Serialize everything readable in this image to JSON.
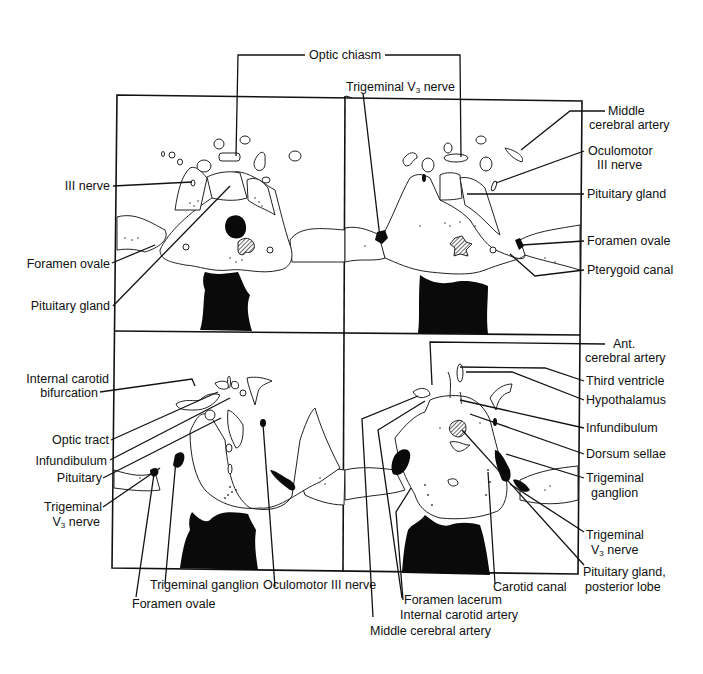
{
  "figure": {
    "panels": [
      {
        "id": "top-left",
        "position": "upper-left"
      },
      {
        "id": "top-right",
        "position": "upper-right"
      },
      {
        "id": "bottom-left",
        "position": "lower-left"
      },
      {
        "id": "bottom-right",
        "position": "lower-right"
      }
    ],
    "labels": {
      "optic_chiasm": "Optic chiasm",
      "trigeminal_v3_top_a": "Trigeminal V",
      "trigeminal_v3_top_sub": "3",
      "trigeminal_v3_top_b": " nerve",
      "middle_cerebral_artery_1": "Middle",
      "middle_cerebral_artery_2": "cerebral artery",
      "oculomotor_1": "Oculomotor",
      "oculomotor_2": "III nerve",
      "pituitary_gland_tr": "Pituitary gland",
      "foramen_ovale_tr": "Foramen ovale",
      "pterygoid_canal": "Pterygoid canal",
      "iii_nerve": "III nerve",
      "foramen_ovale_tl": "Foramen ovale",
      "pituitary_gland_tl": "Pituitary gland",
      "internal_carotid_bif_1": "Internal carotid",
      "internal_carotid_bif_2": "bifurcation",
      "optic_tract": "Optic tract",
      "infundibulum_bl": "Infundibulum",
      "pituitary_bl": "Pituitary",
      "trigeminal_v3_bl_1": "Trigeminal",
      "trigeminal_v3_bl_2a": "V",
      "trigeminal_v3_bl_2sub": "3",
      "trigeminal_v3_bl_2b": " nerve",
      "trigeminal_ganglion_bl": "Trigeminal ganglion",
      "foramen_ovale_bl": "Foramen ovale",
      "oculomotor_iii_bl": "Oculomotor III nerve",
      "ant_cerebral_1": "Ant.",
      "ant_cerebral_2": "cerebral artery",
      "third_ventricle": "Third ventricle",
      "hypothalamus": "Hypothalamus",
      "infundibulum_br": "Infundibulum",
      "dorsum_sellae": "Dorsum sellae",
      "trigeminal_ganglion_br_1": "Trigeminal",
      "trigeminal_ganglion_br_2": "ganglion",
      "trigeminal_v3_br_1": "Trigeminal",
      "trigeminal_v3_br_2a": "V",
      "trigeminal_v3_br_2sub": "3",
      "trigeminal_v3_br_2b": " nerve",
      "pituitary_posterior_1": "Pituitary gland,",
      "pituitary_posterior_2": "posterior lobe",
      "carotid_canal": "Carotid canal",
      "foramen_lacerum": "Foramen lacerum",
      "internal_carotid_artery": "Internal carotid artery",
      "middle_cerebral_artery_br": "Middle cerebral artery"
    }
  }
}
